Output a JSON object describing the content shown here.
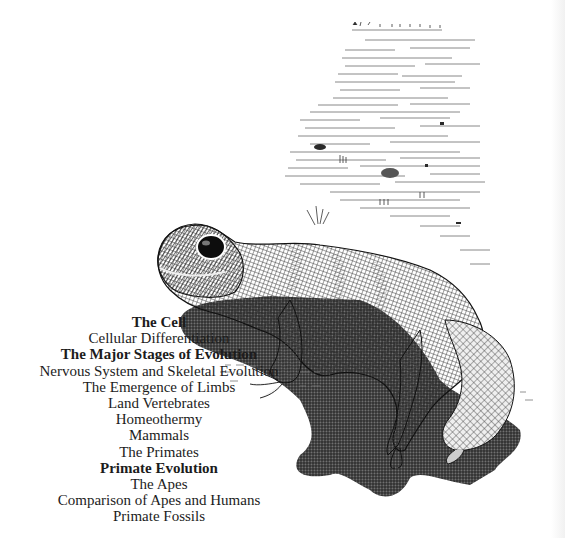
{
  "page": {
    "illustration": {
      "subject": "gecko-lizard-engraving",
      "caption": ""
    },
    "contents": {
      "entries": [
        {
          "label": "The Cell",
          "style": "heading"
        },
        {
          "label": "Cellular Differentiation",
          "style": "normal"
        },
        {
          "label": "The Major Stages of Evolution",
          "style": "heading"
        },
        {
          "label": "Nervous System and Skeletal Evolution",
          "style": "normal"
        },
        {
          "label": "The Emergence of Limbs",
          "style": "normal"
        },
        {
          "label": "Land Vertebrates",
          "style": "normal"
        },
        {
          "label": "Homeothermy",
          "style": "normal"
        },
        {
          "label": "Mammals",
          "style": "normal"
        },
        {
          "label": "The Primates",
          "style": "normal"
        },
        {
          "label": "Primate Evolution",
          "style": "heading"
        },
        {
          "label": "The Apes",
          "style": "normal"
        },
        {
          "label": "Comparison of Apes and Humans",
          "style": "normal"
        },
        {
          "label": "Primate Fossils",
          "style": "normal"
        }
      ]
    },
    "colors": {
      "ink": "#1c1c1c",
      "paper": "#ffffff"
    }
  }
}
